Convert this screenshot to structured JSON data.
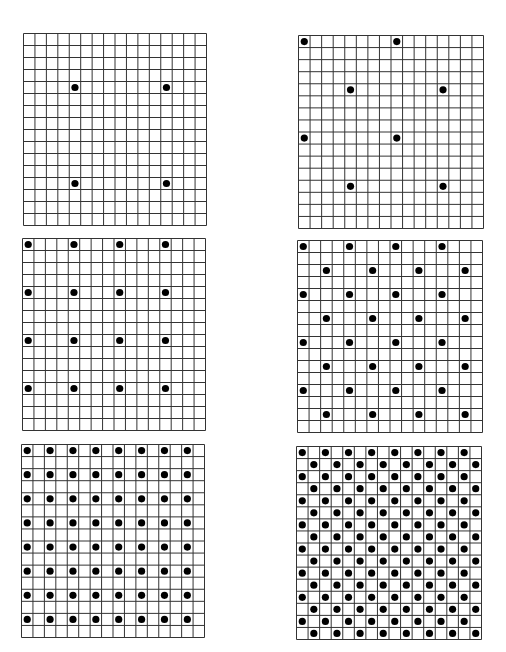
{
  "figure": {
    "grid_cells": 16,
    "line_color": "#333333",
    "dot_color": "#000000",
    "background": "#ffffff"
  },
  "panels": [
    {
      "id": "a",
      "x": 23,
      "y": 33,
      "w": 184,
      "h": 193,
      "pattern": "square",
      "step": 8,
      "offset": [
        4,
        4
      ],
      "stagger": false,
      "dots": [
        [
          4,
          4
        ],
        [
          12,
          4
        ],
        [
          4,
          12
        ],
        [
          12,
          12
        ]
      ]
    },
    {
      "id": "b",
      "x": 298,
      "y": 35,
      "w": 186,
      "h": 194,
      "pattern": "staggered",
      "step": 8,
      "offset": [
        0,
        0
      ],
      "stagger": true,
      "dots": [
        [
          0,
          0
        ],
        [
          8,
          0
        ],
        [
          4,
          4
        ],
        [
          12,
          4
        ],
        [
          0,
          8
        ],
        [
          8,
          8
        ],
        [
          4,
          12
        ],
        [
          12,
          12
        ]
      ]
    },
    {
      "id": "c",
      "x": 22,
      "y": 238,
      "w": 184,
      "h": 193,
      "pattern": "square",
      "step": 4,
      "offset": [
        0,
        0
      ],
      "stagger": false,
      "dots": [
        [
          0,
          0
        ],
        [
          4,
          0
        ],
        [
          8,
          0
        ],
        [
          12,
          0
        ],
        [
          0,
          4
        ],
        [
          4,
          4
        ],
        [
          8,
          4
        ],
        [
          12,
          4
        ],
        [
          0,
          8
        ],
        [
          4,
          8
        ],
        [
          8,
          8
        ],
        [
          12,
          8
        ],
        [
          0,
          12
        ],
        [
          4,
          12
        ],
        [
          8,
          12
        ],
        [
          12,
          12
        ]
      ]
    },
    {
      "id": "d",
      "x": 297,
      "y": 240,
      "w": 186,
      "h": 193,
      "pattern": "staggered",
      "step": 4,
      "offset": [
        0,
        0
      ],
      "stagger": true,
      "dots": [
        [
          0,
          0
        ],
        [
          4,
          0
        ],
        [
          8,
          0
        ],
        [
          12,
          0
        ],
        [
          2,
          2
        ],
        [
          6,
          2
        ],
        [
          10,
          2
        ],
        [
          14,
          2
        ],
        [
          0,
          4
        ],
        [
          4,
          4
        ],
        [
          8,
          4
        ],
        [
          12,
          4
        ],
        [
          2,
          6
        ],
        [
          6,
          6
        ],
        [
          10,
          6
        ],
        [
          14,
          6
        ],
        [
          0,
          8
        ],
        [
          4,
          8
        ],
        [
          8,
          8
        ],
        [
          12,
          8
        ],
        [
          2,
          10
        ],
        [
          6,
          10
        ],
        [
          10,
          10
        ],
        [
          14,
          10
        ],
        [
          0,
          12
        ],
        [
          4,
          12
        ],
        [
          8,
          12
        ],
        [
          12,
          12
        ],
        [
          2,
          14
        ],
        [
          6,
          14
        ],
        [
          10,
          14
        ],
        [
          14,
          14
        ]
      ]
    },
    {
      "id": "e",
      "x": 21,
      "y": 444,
      "w": 184,
      "h": 194,
      "pattern": "square",
      "step": 2,
      "offset": [
        0,
        0
      ],
      "stagger": false,
      "dots": "every 2nd cell in both axes (8x8 = 64 dots)"
    },
    {
      "id": "f",
      "x": 296,
      "y": 446,
      "w": 186,
      "h": 194,
      "pattern": "staggered",
      "step": 2,
      "offset": [
        0,
        0
      ],
      "stagger": true,
      "dots": "checkerboard (128 dots)"
    }
  ]
}
